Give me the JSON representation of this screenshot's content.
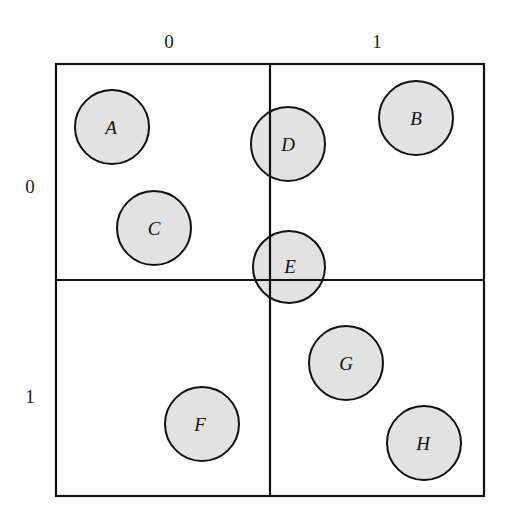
{
  "diagram": {
    "column_labels": [
      "0",
      "1"
    ],
    "row_labels": [
      "0",
      "1"
    ],
    "grid": {
      "rows": 2,
      "cols": 2
    },
    "nodes": [
      {
        "label": "A",
        "cell": [
          0,
          0
        ]
      },
      {
        "label": "B",
        "cell": [
          0,
          1
        ]
      },
      {
        "label": "C",
        "cell": [
          0,
          0
        ]
      },
      {
        "label": "D",
        "cell": [
          0,
          0
        ],
        "spans": "column boundary"
      },
      {
        "label": "E",
        "cell": [
          0,
          0
        ],
        "spans": "both boundaries"
      },
      {
        "label": "F",
        "cell": [
          1,
          0
        ]
      },
      {
        "label": "G",
        "cell": [
          1,
          1
        ]
      },
      {
        "label": "H",
        "cell": [
          1,
          1
        ]
      }
    ],
    "colors": {
      "node_fill": "#e2e2e2",
      "stroke": "#111111",
      "background": "#ffffff"
    }
  }
}
